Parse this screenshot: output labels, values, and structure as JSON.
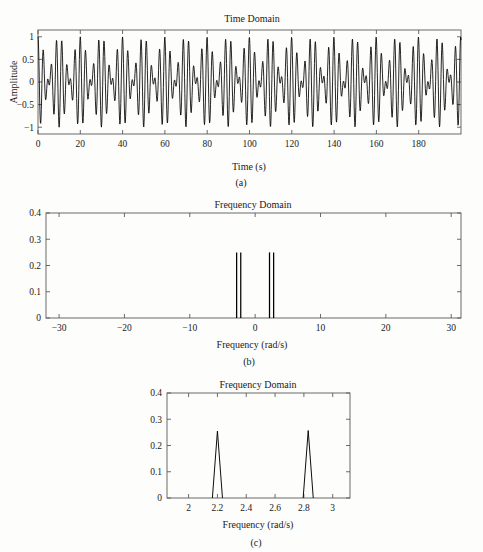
{
  "figure": {
    "background": "#fdfdfc",
    "ink": "#000000",
    "axis_color": "#5a5a5a"
  },
  "panels": {
    "a": {
      "caption": "(a)",
      "title": "Time Domain",
      "xlabel": "Time (s)",
      "ylabel": "Amplitude"
    },
    "b": {
      "caption": "(b)",
      "title": "Frequency Domain",
      "xlabel": "Frequency (rad/s)",
      "ylabel": ""
    },
    "c": {
      "caption": "(c)",
      "title": "Frequency Domain",
      "xlabel": "Frequency (rad/s)",
      "ylabel": ""
    }
  },
  "chart_data": [
    {
      "id": "a",
      "type": "line",
      "title": "Time Domain",
      "xlabel": "Time (s)",
      "ylabel": "Amplitude",
      "xlim": [
        0,
        200
      ],
      "ylim": [
        -1.15,
        1.15
      ],
      "xticks": [
        0,
        20,
        40,
        60,
        80,
        100,
        120,
        140,
        160,
        180
      ],
      "xticklabels": [
        "0",
        "20",
        "40",
        "60",
        "80",
        "100",
        "120",
        "140",
        "160",
        "180"
      ],
      "yticks": [
        -1,
        -0.5,
        0,
        0.5,
        1
      ],
      "yticklabels": [
        "−1",
        "−0.5",
        "0",
        "0.5",
        "1"
      ],
      "grid": false,
      "description": "Sum of two closely spaced sinusoids producing a beat envelope",
      "signal": {
        "model": "0.5*cos(w1*t) + 0.5*cos(w2*t)",
        "w1": 2.2,
        "w2": 2.83,
        "amplitudes": [
          0.5,
          0.5
        ],
        "sample_count": 1400,
        "beat_period_s": 9.97
      }
    },
    {
      "id": "b",
      "type": "bar",
      "title": "Frequency Domain",
      "xlabel": "Frequency (rad/s)",
      "ylabel": "",
      "xlim": [
        -32,
        31.5
      ],
      "ylim": [
        0,
        0.4
      ],
      "xticks": [
        -30,
        -20,
        -10,
        0,
        10,
        20,
        30
      ],
      "xticklabels": [
        "−30",
        "−20",
        "−10",
        "0",
        "10",
        "20",
        "30"
      ],
      "yticks": [
        0,
        0.1,
        0.2,
        0.3,
        0.4
      ],
      "yticklabels": [
        "0",
        "0.1",
        "0.2",
        "0.3",
        "0.4"
      ],
      "grid": false,
      "categories": [
        -2.83,
        -2.2,
        2.2,
        2.83
      ],
      "values": [
        0.25,
        0.25,
        0.25,
        0.25
      ],
      "description": "Two-sided magnitude spectrum: four impulses at plus and minus 2.2 and 2.83 rad/s"
    },
    {
      "id": "c",
      "type": "line",
      "title": "Frequency Domain",
      "xlabel": "Frequency (rad/s)",
      "ylabel": "",
      "xlim": [
        1.85,
        3.12
      ],
      "ylim": [
        0,
        0.4
      ],
      "xticks": [
        2,
        2.2,
        2.4,
        2.6,
        2.8,
        3
      ],
      "xticklabels": [
        "2",
        "2.2",
        "2.4",
        "2.6",
        "2.8",
        "3"
      ],
      "yticks": [
        0,
        0.1,
        0.2,
        0.3,
        0.4
      ],
      "yticklabels": [
        "0",
        "0.1",
        "0.2",
        "0.3",
        "0.4"
      ],
      "grid": false,
      "categories": [
        2.2,
        2.83
      ],
      "values": [
        0.255,
        0.257
      ],
      "peak_half_width": 0.035,
      "description": "Zoomed positive-frequency spectrum showing two narrow peaks near 2.2 and 2.83 rad/s"
    }
  ]
}
